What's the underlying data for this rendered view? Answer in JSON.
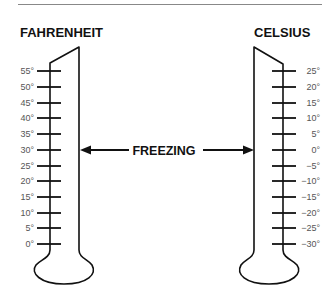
{
  "diagram": {
    "top_rule_color": "#888888",
    "stroke_color": "#111111",
    "fahrenheit": {
      "title": "FAHRENHEIT",
      "ticks": [
        "55°",
        "50°",
        "45°",
        "40°",
        "35°",
        "30°",
        "25°",
        "20°",
        "15°",
        "10°",
        "5°",
        "0°"
      ]
    },
    "celsius": {
      "title": "CELSIUS",
      "ticks": [
        "25°",
        "20°",
        "15°",
        "10°",
        "5°",
        "0°",
        "−5°",
        "−10°",
        "−15°",
        "−20°",
        "−25°",
        "−30°"
      ]
    },
    "center_label": "FREEZING"
  }
}
